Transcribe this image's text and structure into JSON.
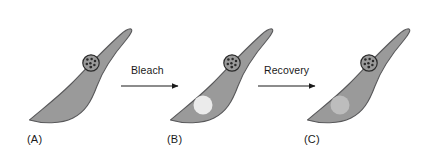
{
  "figure": {
    "background_color": "#ffffff",
    "cell_fill_color": "#9a9a9a",
    "cell_stroke_color": "#58585a",
    "nucleus_fill_color": "#9a9a9a",
    "nucleus_stroke_color": "#2b2b2b",
    "nucleolus_dot_color": "#2b2b2b",
    "arrow_color": "#1a1a1a",
    "label_color": "#1a1a1a"
  },
  "panels": [
    {
      "id": "a",
      "label": "(A)",
      "state": "before-bleach",
      "nucleus": {
        "visible": true,
        "dot_count": 7
      },
      "bleach_spot": {
        "visible": false,
        "color": "",
        "opacity": 0
      }
    },
    {
      "id": "b",
      "label": "(B)",
      "state": "bleached",
      "nucleus": {
        "visible": true,
        "dot_count": 7
      },
      "bleach_spot": {
        "visible": true,
        "color": "#ebebeb",
        "opacity": 1
      }
    },
    {
      "id": "c",
      "label": "(C)",
      "state": "recovered",
      "nucleus": {
        "visible": true,
        "dot_count": 7
      },
      "bleach_spot": {
        "visible": true,
        "color": "#bdbdbd",
        "opacity": 1
      }
    }
  ],
  "arrows": [
    {
      "id": "bleach",
      "label": "Bleach"
    },
    {
      "id": "recovery",
      "label": "Recovery"
    }
  ]
}
